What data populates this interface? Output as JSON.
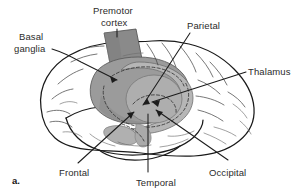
{
  "figure": {
    "panel_label": "a.",
    "caption_type": "anatomical-illustration",
    "background_color": "#ffffff",
    "line_color": "#1a1a1a",
    "text_color": "#2b2b2b"
  },
  "labels": {
    "premotor_cortex_line1": "Premotor",
    "premotor_cortex_line2": "cortex",
    "basal_ganglia_line1": "Basal",
    "basal_ganglia_line2": "ganglia",
    "parietal": "Parietal",
    "thalamus": "Thalamus",
    "frontal": "Frontal",
    "temporal": "Temporal",
    "occipital": "Occipital"
  },
  "regions": {
    "premotor_cortex_fill": "#8c8c8c",
    "basal_ganglia_fill": "#9a9a9a",
    "thalamus_fill": "#a8a8a8",
    "thalamus_ring_fill": "#b4b4b4",
    "cortex_fill": "#ffffff"
  },
  "structures": [
    {
      "name": "premotor-cortex",
      "shading": "dark-gray",
      "label": "Premotor cortex"
    },
    {
      "name": "basal-ganglia",
      "shading": "medium-gray",
      "label": "Basal ganglia"
    },
    {
      "name": "thalamus",
      "shading": "light-gray",
      "label": "Thalamus"
    },
    {
      "name": "frontal-lobe",
      "shading": "none",
      "label": "Frontal"
    },
    {
      "name": "parietal-lobe",
      "shading": "none",
      "label": "Parietal"
    },
    {
      "name": "temporal-lobe",
      "shading": "none",
      "label": "Temporal"
    },
    {
      "name": "occipital-lobe",
      "shading": "none",
      "label": "Occipital"
    }
  ]
}
